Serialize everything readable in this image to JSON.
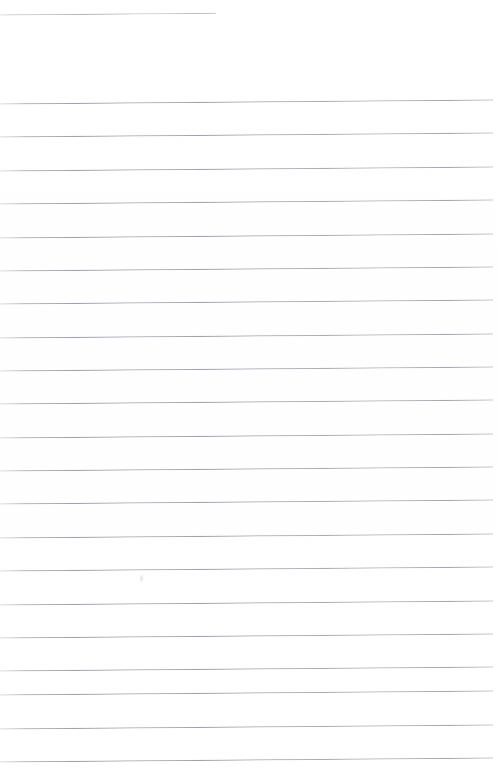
{
  "document": {
    "kind": "scanned-ruled-notepad-page",
    "page_width": 498,
    "page_height": 773,
    "background_color": "#ffffff",
    "rule_color": "#9a9da5",
    "text_content": "",
    "has_visible_text": false,
    "scan_skew_px": -4
  },
  "header_rule": {
    "label": "header-rule",
    "x": 0,
    "y": 14,
    "width": 216,
    "thickness": 1
  },
  "ruled_lines": {
    "count": 21,
    "spacing": 33.35,
    "first_y": 103,
    "left_x": 0,
    "right_x": 493,
    "lines": [
      {
        "index": 1,
        "y": 103,
        "x": 0,
        "width": 493
      },
      {
        "index": 2,
        "y": 136,
        "x": 0,
        "width": 493
      },
      {
        "index": 3,
        "y": 170,
        "x": 0,
        "width": 493
      },
      {
        "index": 4,
        "y": 203,
        "x": 0,
        "width": 493
      },
      {
        "index": 5,
        "y": 237,
        "x": 0,
        "width": 493
      },
      {
        "index": 6,
        "y": 270,
        "x": 0,
        "width": 493
      },
      {
        "index": 7,
        "y": 303,
        "x": 0,
        "width": 493
      },
      {
        "index": 8,
        "y": 337,
        "x": 0,
        "width": 493
      },
      {
        "index": 9,
        "y": 370,
        "x": 0,
        "width": 493
      },
      {
        "index": 10,
        "y": 403,
        "x": 0,
        "width": 493
      },
      {
        "index": 11,
        "y": 437,
        "x": 0,
        "width": 493
      },
      {
        "index": 12,
        "y": 470,
        "x": 0,
        "width": 493
      },
      {
        "index": 13,
        "y": 503,
        "x": 0,
        "width": 493
      },
      {
        "index": 14,
        "y": 537,
        "x": 0,
        "width": 493
      },
      {
        "index": 15,
        "y": 570,
        "x": 0,
        "width": 493
      },
      {
        "index": 16,
        "y": 604,
        "x": 0,
        "width": 493
      },
      {
        "index": 17,
        "y": 637,
        "x": 0,
        "width": 493
      },
      {
        "index": 18,
        "y": 670,
        "x": 0,
        "width": 493
      },
      {
        "index": 19,
        "y": 694,
        "x": 0,
        "width": 493
      },
      {
        "index": 20,
        "y": 728,
        "x": 0,
        "width": 493
      },
      {
        "index": 21,
        "y": 761,
        "x": 0,
        "width": 493
      }
    ]
  },
  "artifacts": [
    {
      "name": "scan-smudge",
      "x": 139,
      "y": 574,
      "width": 5,
      "height": 9
    }
  ]
}
